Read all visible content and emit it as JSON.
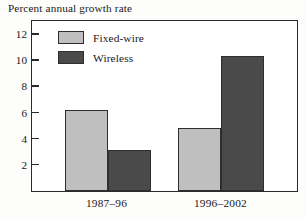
{
  "chart_data": {
    "type": "bar",
    "title": "Percent annual growth rate",
    "xlabel": "",
    "ylabel": "",
    "categories": [
      "1987–96",
      "1996–2002"
    ],
    "series": [
      {
        "name": "Fixed-wire",
        "color": "#bfbfbf",
        "values": [
          6.2,
          4.8
        ]
      },
      {
        "name": "Wireless",
        "color": "#4a4a4a",
        "values": [
          3.1,
          10.3
        ]
      }
    ],
    "ylim": [
      0,
      13
    ],
    "yticks": [
      2,
      4,
      6,
      8,
      10,
      12
    ],
    "ytick_labels": [
      "2",
      "4",
      "6",
      "8",
      "10",
      "12"
    ],
    "grid": false,
    "legend_position": "top-left-inside",
    "frame": true
  }
}
